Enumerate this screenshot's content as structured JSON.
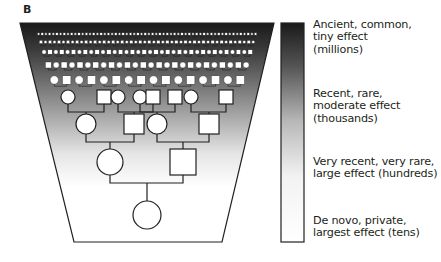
{
  "panel_label": "B",
  "gradient": {
    "top_color": "#1a1a1a",
    "bottom_color": "#ffffff",
    "stroke": "#231f20"
  },
  "legend": [
    {
      "id": "ancient",
      "lines": [
        "Ancient, common,",
        "tiny effect",
        "(millions)"
      ],
      "top": 19
    },
    {
      "id": "recent",
      "lines": [
        "Recent, rare,",
        "moderate effect",
        "(thousands)"
      ],
      "top": 88
    },
    {
      "id": "very-recent",
      "lines": [
        "Very recent, very rare,",
        "large effect (hundreds)"
      ],
      "top": 156
    },
    {
      "id": "de-novo",
      "lines": [
        "De novo, private,",
        "largest effect (tens)"
      ],
      "top": 215
    }
  ],
  "pedigree": {
    "generations": [
      {
        "level": 1,
        "nodes": [
          {
            "shape": "circle",
            "x": 110,
            "y": 162,
            "size": 13
          },
          {
            "shape": "square",
            "x": 183,
            "y": 162,
            "size": 13
          }
        ]
      },
      {
        "level": 2,
        "nodes": [
          {
            "shape": "circle",
            "x": 86,
            "y": 124,
            "size": 10
          },
          {
            "shape": "square",
            "x": 134,
            "y": 124,
            "size": 10
          },
          {
            "shape": "circle",
            "x": 157,
            "y": 124,
            "size": 10
          },
          {
            "shape": "square",
            "x": 209,
            "y": 124,
            "size": 10
          }
        ]
      },
      {
        "level": 3,
        "nodes": [
          {
            "shape": "circle",
            "x": 68,
            "y": 97,
            "size": 7
          },
          {
            "shape": "square",
            "x": 104,
            "y": 97,
            "size": 7
          },
          {
            "shape": "circle",
            "x": 118,
            "y": 97,
            "size": 7
          },
          {
            "shape": "circle",
            "x": 140,
            "y": 97,
            "size": 7
          },
          {
            "shape": "square",
            "x": 153,
            "y": 97,
            "size": 7
          },
          {
            "shape": "square",
            "x": 175,
            "y": 97,
            "size": 7
          },
          {
            "shape": "circle",
            "x": 191,
            "y": 97,
            "size": 7
          },
          {
            "shape": "square",
            "x": 226,
            "y": 97,
            "size": 7
          }
        ]
      }
    ],
    "proband": {
      "shape": "circle",
      "x": 147,
      "y": 215,
      "size": 14
    }
  }
}
